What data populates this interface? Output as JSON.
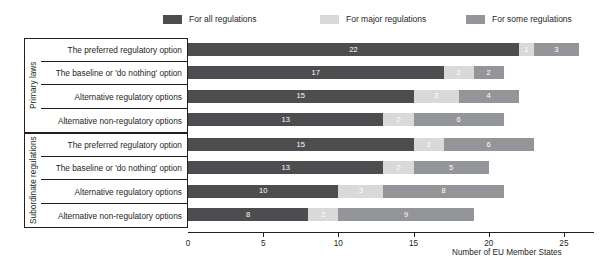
{
  "chart_data": {
    "type": "bar",
    "orientation": "horizontal",
    "stacked": true,
    "title": "",
    "xlabel": "Number of EU Member States",
    "ylabel": "",
    "xlim": [
      0,
      27
    ],
    "xticks": [
      0,
      5,
      10,
      15,
      20,
      25
    ],
    "xticklabels": [
      "0",
      "5",
      "10",
      "15",
      "20",
      "25"
    ],
    "grid": false,
    "legend_position": "top",
    "groups": [
      {
        "name": "Primary laws",
        "categories": [
          "The preferred regulatory option",
          "The baseline or 'do nothing' option",
          "Alternative regulatory options",
          "Alternative non-regulatory options"
        ]
      },
      {
        "name": "Subordinate regulations",
        "categories": [
          "The preferred regulatory option",
          "The baseline or 'do nothing' option",
          "Alternative regulatory options",
          "Alternative non-regulatory options"
        ]
      }
    ],
    "categories": [
      "The preferred regulatory option",
      "The baseline or 'do nothing' option",
      "Alternative regulatory options",
      "Alternative non-regulatory options",
      "The preferred regulatory option",
      "The baseline or 'do nothing' option",
      "Alternative regulatory options",
      "Alternative non-regulatory options"
    ],
    "series": [
      {
        "name": "For all regulations",
        "color": "#4d4d4f",
        "values": [
          22,
          17,
          15,
          13,
          15,
          13,
          10,
          8
        ]
      },
      {
        "name": "For major regulations",
        "color": "#d9d9d9",
        "values": [
          1,
          2,
          3,
          2,
          2,
          2,
          3,
          2
        ]
      },
      {
        "name": "For some regulations",
        "color": "#939598",
        "values": [
          3,
          2,
          4,
          6,
          6,
          5,
          8,
          9
        ]
      }
    ],
    "bar_labels": [
      [
        "22",
        "1",
        "3"
      ],
      [
        "17",
        "2",
        "2"
      ],
      [
        "15",
        "3",
        "4"
      ],
      [
        "13",
        "2",
        "6"
      ],
      [
        "15",
        "2",
        "6"
      ],
      [
        "13",
        "2",
        "5"
      ],
      [
        "10",
        "3",
        "8"
      ],
      [
        "8",
        "2",
        "9"
      ]
    ]
  },
  "legend": {
    "items": [
      {
        "label": "For all regulations",
        "color": "#4d4d4f",
        "swatch_name": "legend-swatch-all"
      },
      {
        "label": "For major regulations",
        "color": "#d9d9d9",
        "swatch_name": "legend-swatch-major"
      },
      {
        "label": "For some regulations",
        "color": "#939598",
        "swatch_name": "legend-swatch-some"
      }
    ]
  },
  "axis": {
    "x_title": "Number of EU Member States"
  },
  "colors": {
    "all": "#4d4d4f",
    "major": "#d9d9d9",
    "some": "#939598",
    "axis": "#231f20",
    "background": "#ffffff"
  }
}
